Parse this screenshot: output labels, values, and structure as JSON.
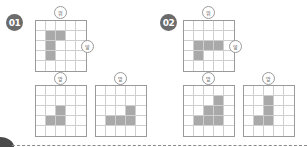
{
  "problems": [
    {
      "number": "01",
      "top_view": {
        "label": "위",
        "shaded": [
          [
            1,
            1
          ],
          [
            1,
            2
          ],
          [
            2,
            1
          ],
          [
            3,
            1
          ]
        ]
      },
      "side_label": "옆",
      "front_view": {
        "label": "앞",
        "shaded": [
          [
            2,
            2
          ],
          [
            3,
            1
          ],
          [
            3,
            2
          ]
        ]
      },
      "right_view": {
        "label": "앞",
        "shaded": [
          [
            2,
            3
          ],
          [
            3,
            1
          ],
          [
            3,
            2
          ],
          [
            3,
            3
          ]
        ]
      }
    },
    {
      "number": "02",
      "top_view": {
        "label": "위",
        "shaded": [
          [
            2,
            1
          ],
          [
            2,
            2
          ],
          [
            2,
            3
          ],
          [
            3,
            1
          ]
        ]
      },
      "side_label": "옆",
      "front_view": {
        "label": "앞",
        "shaded": [
          [
            1,
            3
          ],
          [
            2,
            2
          ],
          [
            2,
            3
          ],
          [
            3,
            1
          ],
          [
            3,
            2
          ],
          [
            3,
            3
          ]
        ]
      },
      "right_view": {
        "label": "앞",
        "shaded": [
          [
            1,
            2
          ],
          [
            2,
            2
          ],
          [
            3,
            1
          ],
          [
            3,
            2
          ]
        ]
      }
    }
  ],
  "colors": {
    "shade": "#a9a9a9",
    "badge": "#6b6b6b",
    "grid_line": "#cfcfcf",
    "grid_border": "#9a9a9a"
  }
}
